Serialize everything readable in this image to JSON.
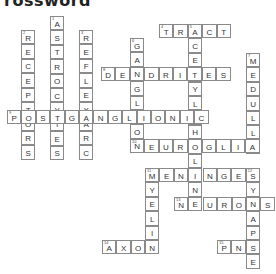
{
  "title": "rossword",
  "pitch": 14.4,
  "words": [
    {
      "num": "1",
      "answer": "ASTROCYTES",
      "dir": "down",
      "x": 50,
      "y": 16
    },
    {
      "num": "2",
      "answer": "RECEPTORS",
      "dir": "down",
      "x": 21,
      "y": 30
    },
    {
      "num": "3",
      "answer": "REFLEXARC",
      "dir": "down",
      "x": 79,
      "y": 30
    },
    {
      "num": "4",
      "answer": "TRACT",
      "dir": "across",
      "x": 159,
      "y": 24
    },
    {
      "num": "5",
      "answer": "ACETYLCHOLINE",
      "dir": "down",
      "x": 188,
      "y": 24
    },
    {
      "num": "6",
      "answer": "GANGLION",
      "dir": "down",
      "x": 130,
      "y": 38
    },
    {
      "num": "7",
      "answer": "MEDULLA",
      "dir": "down",
      "x": 246,
      "y": 53
    },
    {
      "num": "8",
      "answer": "DENDRITES",
      "dir": "across",
      "x": 101,
      "y": 67
    },
    {
      "num": "9",
      "answer": "POSTGANGLIONIC",
      "dir": "across",
      "x": 7,
      "y": 110
    },
    {
      "num": "10",
      "answer": "NEUROGLIA",
      "dir": "across",
      "x": 130,
      "y": 139
    },
    {
      "num": "11",
      "answer": "MENINGES",
      "dir": "across",
      "x": 145,
      "y": 168
    },
    {
      "num": "",
      "answer": "MYELIN",
      "dir": "down",
      "x": 145,
      "y": 168
    },
    {
      "num": "12",
      "answer": "SYNAPSE",
      "dir": "down",
      "x": 246,
      "y": 168
    },
    {
      "num": "13",
      "answer": "NEURONS",
      "dir": "across",
      "x": 174,
      "y": 197
    },
    {
      "num": "14",
      "answer": "AXON",
      "dir": "across",
      "x": 102,
      "y": 240
    },
    {
      "num": "15",
      "answer": "PNS",
      "dir": "across",
      "x": 217,
      "y": 240
    }
  ]
}
